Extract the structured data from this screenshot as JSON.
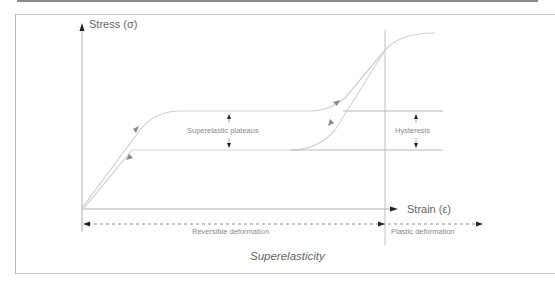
{
  "diagram": {
    "title": "Superelasticity",
    "y_axis_label": "Stress (σ)",
    "x_axis_label": "Strain (ε)",
    "annotations": {
      "plateaus": "Superelastic plateaus",
      "hysteresis": "Hysteresis"
    },
    "regions": {
      "reversible": "Reversible deformation",
      "plastic": "Plastic deformation"
    },
    "colors": {
      "axis": "#b0b0b0",
      "curve": "#c8c8c8",
      "arrow": "#222222",
      "curve_arrow": "#888888",
      "text": "#6a6a6a"
    }
  }
}
